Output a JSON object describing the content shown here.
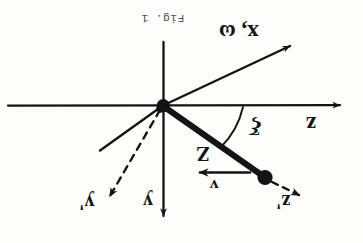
{
  "figure": {
    "caption": "Fig. 1",
    "orientation_note": "180",
    "background_color": "#fdfdfc",
    "ink_color": "#141414",
    "labels": {
      "x_omega": "x, ω",
      "z_axis": "z",
      "y_axis": "y",
      "y_prime": "y'",
      "z_prime": "z'",
      "angle": "ξ",
      "big_z": "Z",
      "velocity": "v"
    },
    "geometry": {
      "origin": {
        "x": 163,
        "y": 105
      },
      "bob": {
        "x": 265,
        "y": 177
      },
      "z_axis_end": {
        "x": 345,
        "y": 105
      },
      "z_axis_start": {
        "x": 8,
        "y": 105
      },
      "y_axis_end": {
        "x": 163,
        "y": 222
      },
      "y_axis_start": {
        "x": 163,
        "y": 42
      },
      "x_omega_end": {
        "x": 296,
        "y": 42
      },
      "x_omega_back_end": {
        "x": 100,
        "y": 150
      },
      "y_prime_end": {
        "x": 104,
        "y": 200
      },
      "z_prime_end": {
        "x": 303,
        "y": 198
      },
      "velocity_arrow": {
        "from_x": 248,
        "from_y": 172,
        "to_x": 196,
        "to_y": 172
      },
      "angle_arc_radius": 72
    }
  }
}
